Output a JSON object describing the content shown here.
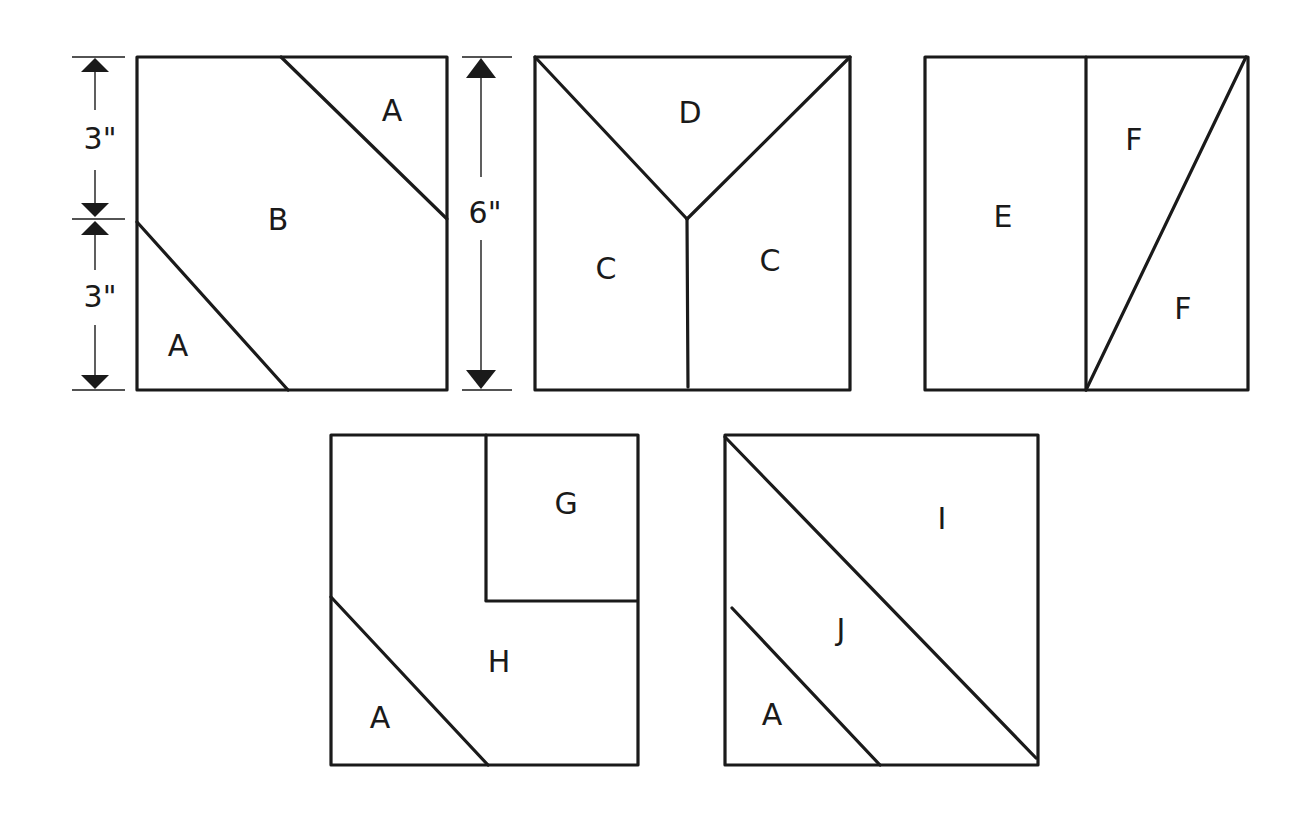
{
  "diagram": {
    "type": "quilt-block-piece-patterns",
    "background": "#ffffff",
    "line_color": "#1a1a1a",
    "dimensions": {
      "upper_half": "3\"",
      "lower_half": "3\"",
      "full_height": "6\""
    },
    "blocks": [
      {
        "id": "block-1",
        "pieces": [
          "A",
          "B",
          "A"
        ],
        "labels": {
          "top_right": "A",
          "center": "B",
          "bottom_left": "A"
        }
      },
      {
        "id": "block-2",
        "pieces": [
          "D",
          "C",
          "C"
        ],
        "labels": {
          "top": "D",
          "left": "C",
          "right": "C"
        }
      },
      {
        "id": "block-3",
        "pieces": [
          "E",
          "F",
          "F"
        ],
        "labels": {
          "left": "E",
          "top_right": "F",
          "bottom_right": "F"
        }
      },
      {
        "id": "block-4",
        "pieces": [
          "G",
          "H",
          "A"
        ],
        "labels": {
          "top_right": "G",
          "center": "H",
          "bottom_left": "A"
        }
      },
      {
        "id": "block-5",
        "pieces": [
          "I",
          "J",
          "A"
        ],
        "labels": {
          "top_right": "I",
          "middle": "J",
          "bottom_left": "A"
        }
      }
    ]
  }
}
